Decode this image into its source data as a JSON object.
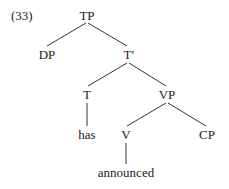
{
  "example_number": "(33)",
  "tree": {
    "nodes": {
      "tp": "TP",
      "dp": "DP",
      "tbar": "T′",
      "t": "T",
      "vp": "VP",
      "has": "has",
      "v": "V",
      "cp": "CP",
      "announced": "announced"
    },
    "edges": [
      [
        "TP",
        "DP"
      ],
      [
        "TP",
        "T′"
      ],
      [
        "T′",
        "T"
      ],
      [
        "T′",
        "VP"
      ],
      [
        "T",
        "has"
      ],
      [
        "VP",
        "V"
      ],
      [
        "VP",
        "CP"
      ],
      [
        "V",
        "announced"
      ]
    ]
  }
}
